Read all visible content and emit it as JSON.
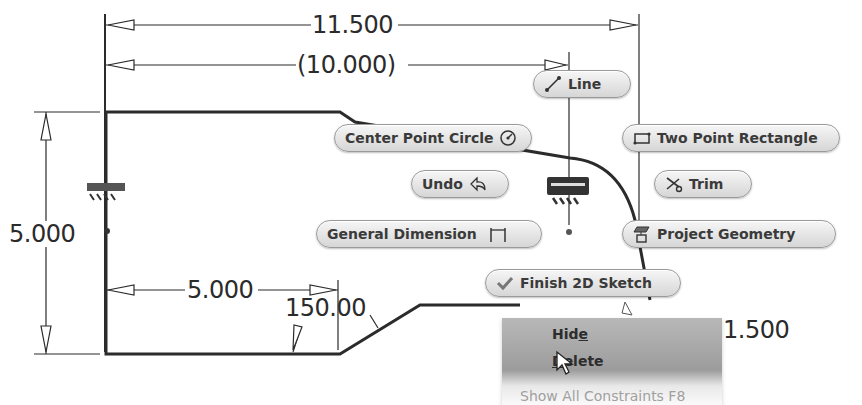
{
  "dimensions": {
    "overall_width": "11.500",
    "reference_width": "(10.000)",
    "height": "5.000",
    "bottom_length": "5.000",
    "angle": "150.00",
    "partial_right": "1.500"
  },
  "marking_menu": {
    "line": {
      "label": "Line",
      "icon": "line-icon"
    },
    "center_point_circle": {
      "label": "Center Point Circle",
      "icon": "circle-icon"
    },
    "two_point_rectangle": {
      "label": "Two Point Rectangle",
      "icon": "rectangle-icon"
    },
    "undo": {
      "label": "Undo",
      "icon": "undo-icon"
    },
    "trim": {
      "label": "Trim",
      "icon": "scissors-icon"
    },
    "general_dimension": {
      "label": "General Dimension",
      "icon": "dimension-icon"
    },
    "project_geometry": {
      "label": "Project Geometry",
      "icon": "project-geometry-icon"
    },
    "finish_2d_sketch": {
      "label": "Finish 2D Sketch",
      "icon": "checkmark-icon"
    }
  },
  "context_menu": {
    "items": [
      {
        "label_pre": "Hid",
        "label_accel": "e",
        "label_post": ""
      },
      {
        "label_pre": "",
        "label_accel": "D",
        "label_post": "elete"
      }
    ],
    "faded_item": "Show All Constraints     F8"
  },
  "colors": {
    "line": "#2b2b2b",
    "pill_top": "#f6f6f6",
    "pill_bottom": "#d6d6d6",
    "menu_highlight": "#9c9c9c"
  }
}
